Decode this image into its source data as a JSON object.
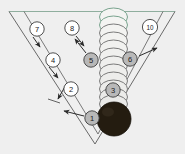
{
  "figure": {
    "name": "v-trough-stacked-disc-diagram",
    "background_color": "#efefef",
    "width": 185,
    "height": 154,
    "line_color": "#5a5a5a",
    "callout_fill_white": "#ffffff",
    "callout_fill_gray": "#b8b8b8",
    "callout_stroke": "#3c3c3c",
    "disc_stack_stroke": "#6b6b6b",
    "disc_stack_tint": "#7fb79a",
    "dark_sphere_color": "#241c10"
  },
  "structure": {
    "v_outer_label": "outer-v-wall",
    "v_inner_label": "inner-v-wall",
    "top_rim_label": "top-rim-line",
    "disc_stack_label": "stacked-discs-column",
    "dark_sphere_label": "dark-sphere"
  },
  "callouts": [
    {
      "id": "1",
      "label": "1",
      "fill": "gray",
      "cx": 92,
      "cy": 118
    },
    {
      "id": "2",
      "label": "2",
      "fill": "white",
      "cx": 71,
      "cy": 89
    },
    {
      "id": "3",
      "label": "3",
      "fill": "gray",
      "cx": 113,
      "cy": 90
    },
    {
      "id": "4",
      "label": "4",
      "fill": "white",
      "cx": 53,
      "cy": 60
    },
    {
      "id": "5",
      "label": "5",
      "fill": "gray",
      "cx": 91,
      "cy": 60
    },
    {
      "id": "6",
      "label": "6",
      "fill": "gray",
      "cx": 130,
      "cy": 59
    },
    {
      "id": "7",
      "label": "7",
      "fill": "white",
      "cx": 37,
      "cy": 29
    },
    {
      "id": "8",
      "label": "8",
      "fill": "white",
      "cx": 72,
      "cy": 28
    },
    {
      "id": "10",
      "label": "10",
      "fill": "white",
      "cx": 150,
      "cy": 27
    }
  ],
  "leaders": [
    {
      "name": "leader-1-to-inner-wall",
      "from": [
        84,
        115
      ],
      "to": [
        63,
        110
      ]
    },
    {
      "name": "leader-2-to-outer-wall",
      "from": [
        66,
        82
      ],
      "to": [
        57,
        100
      ]
    },
    {
      "name": "leader-4-to-wall",
      "from": [
        49,
        67
      ],
      "to": [
        58,
        77
      ]
    },
    {
      "name": "leader-5-to-discs",
      "from": [
        86,
        52
      ],
      "to": [
        74,
        38
      ]
    },
    {
      "name": "leader-6-to-right-wall",
      "from": [
        138,
        56
      ],
      "to": [
        157,
        49
      ]
    },
    {
      "name": "leader-7-to-wall",
      "from": [
        33,
        36
      ],
      "to": [
        40,
        46
      ]
    },
    {
      "name": "leader-8-to-discs",
      "from": [
        76,
        35
      ],
      "to": [
        84,
        45
      ]
    }
  ]
}
